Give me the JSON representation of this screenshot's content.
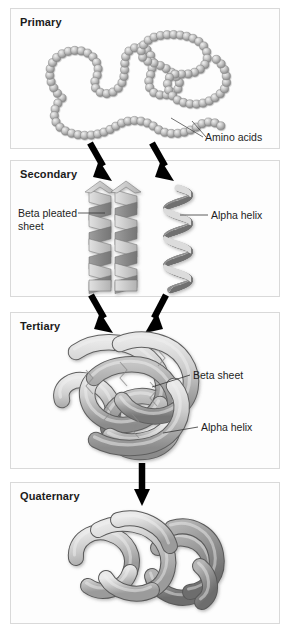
{
  "figure": {
    "background_color": "#ffffff",
    "panel_border_color": "#d9d9d9",
    "panel_fill_color": "#fdfdfd",
    "ink_color": "#1e1e1e",
    "arrow_color": "#000000"
  },
  "panels": [
    {
      "id": "primary",
      "label": "Primary",
      "bead_color_light": "#d2d2d2",
      "bead_color_dark": "#9a9a9a",
      "bead_count": 96,
      "callouts": [
        {
          "id": "amino-acids",
          "label": "Amino acids"
        }
      ]
    },
    {
      "id": "secondary",
      "label": "Secondary",
      "ribbon_light": "#c9c9c9",
      "ribbon_dark": "#8a8a8a",
      "callouts": [
        {
          "id": "beta-pleated-sheet",
          "label": "Beta pleated sheet"
        },
        {
          "id": "alpha-helix",
          "label": "Alpha helix"
        }
      ]
    },
    {
      "id": "tertiary",
      "label": "Tertiary",
      "tube_light": "#d4d4d4",
      "tube_dark": "#8f8f8f",
      "callouts": [
        {
          "id": "beta-sheet",
          "label": "Beta sheet"
        },
        {
          "id": "alpha-helix",
          "label": "Alpha helix"
        }
      ]
    },
    {
      "id": "quaternary",
      "label": "Quaternary",
      "subunit_light": "#d6d6d6",
      "subunit_dark": "#8c8c8c",
      "callouts": []
    }
  ],
  "arrows": [
    {
      "id": "primary-to-secondary-left",
      "direction": "down-right"
    },
    {
      "id": "primary-to-secondary-right",
      "direction": "down-right"
    },
    {
      "id": "secondary-to-tertiary-left",
      "direction": "down-right"
    },
    {
      "id": "secondary-to-tertiary-right",
      "direction": "down-left"
    },
    {
      "id": "tertiary-to-quaternary",
      "direction": "down"
    }
  ]
}
